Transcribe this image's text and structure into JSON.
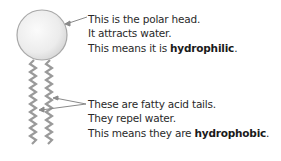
{
  "head_label": {
    "line1": "This is the polar head.",
    "line2": "It attracts water.",
    "line3_prefix": "This means it is ",
    "line3_bold": "hydrophilic",
    "line3_suffix": "."
  },
  "tail_label": {
    "line1": "These are fatty acid tails.",
    "line2": "They repel water.",
    "line3_prefix": "This means they are ",
    "line3_bold": "hydrophobic",
    "line3_suffix": "."
  },
  "colors": {
    "head_fill": "#ededed",
    "outline": "#9a9a9a",
    "text": "#2a2a2a"
  }
}
